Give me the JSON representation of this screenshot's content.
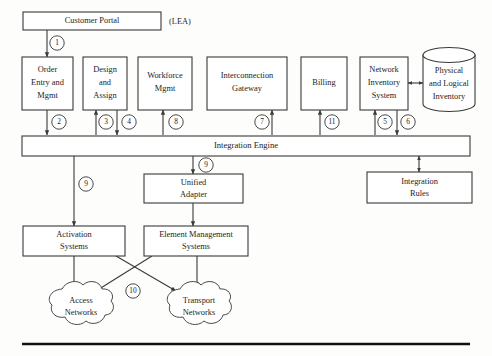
{
  "figure": {
    "side_note": "(LEA)",
    "colors": {
      "stroke": "#3a3a3a",
      "text": "#1c1c1c",
      "background": "#fdfdfc",
      "rule": "#111111"
    }
  },
  "nodes": {
    "customer_portal": {
      "label": "Customer Portal"
    },
    "order_entry": {
      "line1": "Order",
      "line2": "Entry and",
      "line3": "Mgmt"
    },
    "design_assign": {
      "line1": "Design",
      "line2": "and",
      "line3": "Assign"
    },
    "workforce_mgmt": {
      "line1": "Workforce",
      "line2": "Mgmt"
    },
    "interconnection_gateway": {
      "line1": "Interconnection",
      "line2": "Gateway"
    },
    "billing": {
      "label": "Billing"
    },
    "network_inventory": {
      "line1": "Network",
      "line2": "Inventory",
      "line3": "System"
    },
    "physical_logical_inventory": {
      "line1": "Physical",
      "line2": "and Logical",
      "line3": "Inventory"
    },
    "integration_engine": {
      "label": "Integration Engine"
    },
    "unified_adapter": {
      "line1": "Unified",
      "line2": "Adapter"
    },
    "integration_rules": {
      "line1": "Integration",
      "line2": "Rules"
    },
    "activation_systems": {
      "line1": "Activation",
      "line2": "Systems"
    },
    "element_management": {
      "line1": "Element Management",
      "line2": "Systems"
    },
    "access_networks": {
      "line1": "Access",
      "line2": "Networks"
    },
    "transport_networks": {
      "line1": "Transport",
      "line2": "Networks"
    }
  },
  "connector_labels": {
    "portal_to_order": "1",
    "order_to_engine": "2",
    "engine_to_design": "3",
    "design_to_engine": "4",
    "engine_to_inventory": "5",
    "inventory_to_engine": "6",
    "engine_to_interconnection": "7",
    "engine_to_workforce": "8",
    "engine_to_activation": "9",
    "engine_to_adapter": "9",
    "cross_networks": "10",
    "engine_to_billing": "11"
  }
}
